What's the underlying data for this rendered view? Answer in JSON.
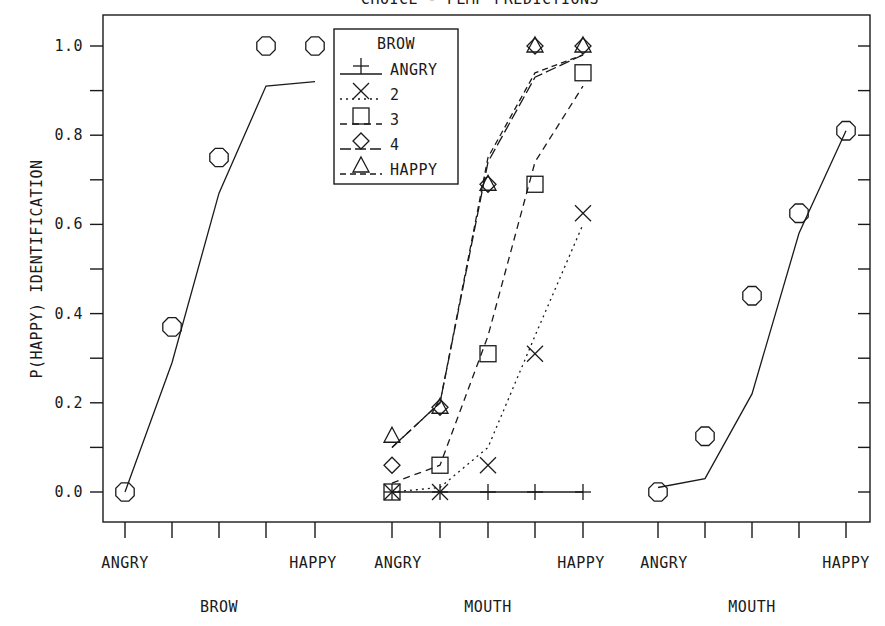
{
  "title": "CHOICE - FLMP PREDICTIONS",
  "colors": {
    "ink": "#1a1a1a",
    "background": "#ffffff"
  },
  "y_axis": {
    "label": "P(HAPPY) IDENTIFICATION",
    "ticks": [
      "0.0",
      "0.2",
      "0.4",
      "0.6",
      "0.8",
      "1.0"
    ]
  },
  "legend": {
    "title": "BROW",
    "entries": [
      {
        "label": "ANGRY",
        "marker": "plus",
        "line": "solid"
      },
      {
        "label": "2",
        "marker": "x",
        "line": "dotted"
      },
      {
        "label": "3",
        "marker": "square",
        "line": "dash-dot"
      },
      {
        "label": "4",
        "marker": "diamond",
        "line": "long-dash"
      },
      {
        "label": "HAPPY",
        "marker": "triangle",
        "line": "dashed"
      }
    ]
  },
  "panels": [
    {
      "xlabel": "BROW",
      "tick_left": "ANGRY",
      "tick_right": "HAPPY"
    },
    {
      "xlabel": "MOUTH",
      "tick_left": "ANGRY",
      "tick_right": "HAPPY"
    },
    {
      "xlabel": "MOUTH",
      "tick_left": "ANGRY",
      "tick_right": "HAPPY"
    }
  ],
  "chart_data": {
    "type": "line",
    "title": "CHOICE - FLMP PREDICTIONS",
    "ylabel": "P(HAPPY) IDENTIFICATION",
    "ylim": [
      -0.07,
      1.05
    ],
    "yticks": [
      0.0,
      0.2,
      0.4,
      0.6,
      0.8,
      1.0
    ],
    "grid": false,
    "legend_position": "upper center (middle panel)",
    "note": "Points = observed, lines = FLMP predictions",
    "panels": [
      {
        "name": "Brow alone",
        "xlabel": "BROW",
        "categories": [
          "ANGRY",
          "2",
          "3",
          "4",
          "HAPPY"
        ],
        "series": [
          {
            "name": "observed",
            "marker": "circle",
            "values": [
              0.0,
              0.37,
              0.75,
              1.0,
              1.0
            ]
          },
          {
            "name": "predicted",
            "line": "solid",
            "values": [
              0.0,
              0.29,
              0.67,
              0.91,
              0.92
            ]
          }
        ]
      },
      {
        "name": "Bimodal (mouth x brow)",
        "xlabel": "MOUTH",
        "categories": [
          "ANGRY",
          "2",
          "3",
          "4",
          "HAPPY"
        ],
        "series": [
          {
            "name": "ANGRY",
            "marker": "plus",
            "line": "solid",
            "observed": [
              0.0,
              0.0,
              0.0,
              0.0,
              0.0
            ],
            "predicted": [
              0.0,
              0.0,
              0.0,
              0.0,
              0.0
            ]
          },
          {
            "name": "2",
            "marker": "x",
            "line": "dotted",
            "observed": [
              0.0,
              0.0,
              0.06,
              0.31,
              0.625
            ],
            "predicted": [
              0.0,
              0.01,
              0.1,
              0.35,
              0.6
            ]
          },
          {
            "name": "3",
            "marker": "square",
            "line": "dash-dot",
            "observed": [
              0.0,
              0.06,
              0.31,
              0.69,
              0.94
            ],
            "predicted": [
              0.02,
              0.06,
              0.35,
              0.74,
              0.91
            ]
          },
          {
            "name": "4",
            "marker": "diamond",
            "line": "long-dash",
            "observed": [
              0.06,
              0.19,
              0.69,
              1.0,
              1.0
            ],
            "predicted": [
              0.1,
              0.2,
              0.74,
              0.93,
              0.98
            ]
          },
          {
            "name": "HAPPY",
            "marker": "triangle",
            "line": "dashed",
            "observed": [
              0.125,
              0.19,
              0.69,
              1.0,
              1.0
            ],
            "predicted": [
              0.1,
              0.2,
              0.75,
              0.94,
              0.98
            ]
          }
        ]
      },
      {
        "name": "Mouth alone",
        "xlabel": "MOUTH",
        "categories": [
          "ANGRY",
          "2",
          "3",
          "4",
          "HAPPY"
        ],
        "series": [
          {
            "name": "observed",
            "marker": "circle",
            "values": [
              0.0,
              0.125,
              0.44,
              0.625,
              0.81
            ]
          },
          {
            "name": "predicted",
            "line": "solid",
            "values": [
              0.01,
              0.03,
              0.22,
              0.58,
              0.81
            ]
          }
        ]
      }
    ]
  }
}
